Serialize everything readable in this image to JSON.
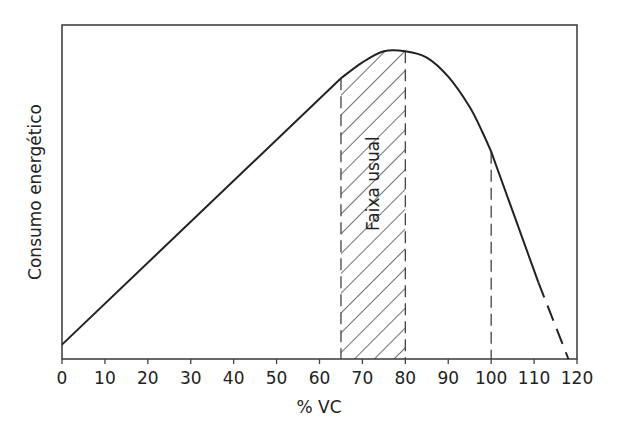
{
  "chart_data": {
    "type": "line",
    "title": "",
    "xlabel": "% VC",
    "ylabel": "Consumo energético",
    "xlim": [
      0,
      120
    ],
    "ylim": [
      0,
      100
    ],
    "xticks": [
      0,
      10,
      20,
      30,
      40,
      50,
      60,
      70,
      80,
      90,
      100,
      110,
      120
    ],
    "xtick_labels": [
      "0",
      "10",
      "20",
      "30",
      "40",
      "50",
      "60",
      "70",
      "80",
      "90",
      "100",
      "110",
      "120"
    ],
    "yticks": [],
    "grid": false,
    "series": [
      {
        "name": "Consumo energético (sólido)",
        "style": "solid",
        "x": [
          0,
          65,
          70,
          75,
          80,
          85,
          90,
          95,
          98,
          100,
          111
        ],
        "y": [
          4.5,
          88,
          93,
          96.5,
          96.5,
          94.5,
          88.5,
          79,
          71,
          65,
          24
        ]
      },
      {
        "name": "Consumo energético (extrapolado)",
        "style": "dashed",
        "x": [
          111,
          118
        ],
        "y": [
          24,
          0
        ]
      }
    ],
    "shaded_region": {
      "x": [
        65,
        80
      ],
      "pattern": "diagonal-hatch",
      "label": "Faixa usual"
    },
    "reference_lines": [
      {
        "x": 65,
        "style": "dashed"
      },
      {
        "x": 80,
        "style": "dashed"
      },
      {
        "x": 100,
        "style": "dashed"
      }
    ],
    "annotations": [
      {
        "text": "Faixa usual",
        "x": 72.5,
        "y": 55,
        "rotation": "vertical"
      }
    ],
    "legend": "none"
  }
}
